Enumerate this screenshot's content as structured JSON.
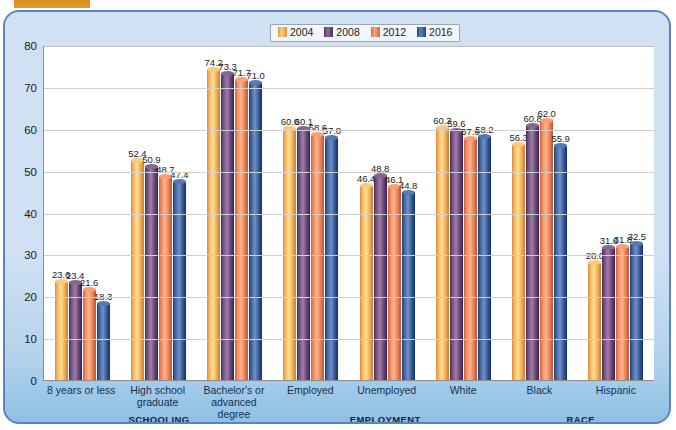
{
  "legend": {
    "items": [
      {
        "label": "2004",
        "color": "#f2ad5c"
      },
      {
        "label": "2008",
        "color": "#6b4a78"
      },
      {
        "label": "2012",
        "color": "#e8825a"
      },
      {
        "label": "2016",
        "color": "#3b5c94"
      }
    ]
  },
  "sections": [
    {
      "label": "SCHOOLING",
      "center_pct": 19
    },
    {
      "label": "EMPLOYMENT",
      "center_pct": 56
    },
    {
      "label": "RACE",
      "center_pct": 88
    }
  ],
  "chart_data": {
    "type": "bar",
    "title": "",
    "xlabel": "",
    "ylabel": "",
    "ylim": [
      0,
      80
    ],
    "yticks": [
      0,
      10,
      20,
      30,
      40,
      50,
      60,
      70,
      80
    ],
    "grid": true,
    "legend_position": "top-center",
    "categories": [
      "8 years or less",
      "High school graduate",
      "Bachelor's or advanced degree",
      "Employed",
      "Unemployed",
      "White",
      "Black",
      "Hispanic"
    ],
    "series": [
      {
        "name": "2004",
        "color": "#f2ad5c",
        "values": [
          23.6,
          52.4,
          74.2,
          60.0,
          46.4,
          60.3,
          56.3,
          28.0
        ]
      },
      {
        "name": "2008",
        "color": "#6b4a78",
        "values": [
          23.4,
          50.9,
          73.3,
          60.1,
          48.8,
          59.6,
          60.8,
          31.6
        ]
      },
      {
        "name": "2012",
        "color": "#e8825a",
        "values": [
          21.6,
          48.7,
          71.7,
          58.6,
          46.1,
          57.6,
          62.0,
          31.8
        ]
      },
      {
        "name": "2016",
        "color": "#3b5c94",
        "values": [
          18.3,
          47.4,
          71.0,
          57.8,
          44.8,
          58.2,
          55.9,
          32.5
        ]
      }
    ]
  }
}
